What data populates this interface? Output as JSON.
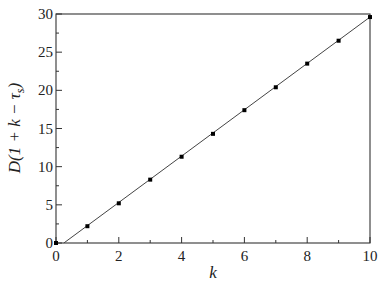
{
  "chart_data": {
    "type": "line",
    "title": "",
    "xlabel": "k",
    "ylabel": "D(1 + k − τs)",
    "ylabel_parts": {
      "prefix": "D(1 + ",
      "k": "k",
      "minus": " − τ",
      "sub": "s",
      "suffix": ")"
    },
    "xlim": [
      0,
      10
    ],
    "ylim": [
      0,
      30
    ],
    "x_ticks": [
      0,
      2,
      4,
      6,
      8,
      10
    ],
    "x_minor_ticks": [
      1,
      3,
      5,
      7,
      9
    ],
    "y_ticks": [
      0,
      5,
      10,
      15,
      20,
      25,
      30
    ],
    "y_minor_ticks": [
      2.5,
      7.5,
      12.5,
      17.5,
      22.5,
      27.5
    ],
    "grid": false,
    "legend": null,
    "series": [
      {
        "name": "data points",
        "style": "markers",
        "x": [
          0,
          1,
          2,
          3,
          4,
          5,
          6,
          7,
          8,
          9,
          10
        ],
        "y": [
          0.0,
          2.2,
          5.2,
          8.3,
          11.3,
          14.3,
          17.4,
          20.4,
          23.5,
          26.5,
          29.6
        ]
      },
      {
        "name": "linear fit",
        "style": "line",
        "x": [
          0.25,
          10
        ],
        "y": [
          0.0,
          29.6
        ]
      }
    ],
    "colors": {
      "axis": "#333333",
      "line": "#444444",
      "marker": "#000000"
    }
  }
}
